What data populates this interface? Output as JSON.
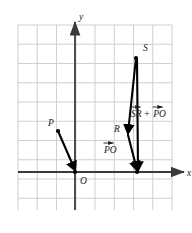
{
  "figure": {
    "type": "vector-diagram",
    "background": "#ffffff",
    "grid": {
      "show": true,
      "color": "#c9c9cf",
      "spacing_px": 19.25,
      "x_start_px": 18,
      "x_end_px": 172,
      "y_start_px": 25,
      "y_end_px": 210,
      "columns": 9,
      "rows": 10
    },
    "axes": {
      "color": "#3a3a3a",
      "x_axis": {
        "label": "x",
        "y_px": 172,
        "x_from_px": 18,
        "x_to_px": 184,
        "arrow": "right"
      },
      "y_axis": {
        "label": "y",
        "x_px": 75,
        "y_from_px": 210,
        "y_to_px": 22,
        "arrow": "up"
      }
    },
    "points": [
      {
        "name": "P",
        "label": "P",
        "x_px": 58,
        "y_px": 131,
        "label_x_px": 48,
        "label_y_px": 126,
        "dot": true
      },
      {
        "name": "O",
        "label": "O",
        "x_px": 75,
        "y_px": 172,
        "label_x_px": 80,
        "label_y_px": 184,
        "dot": true
      },
      {
        "name": "R",
        "label": "R",
        "x_px": 128,
        "y_px": 133,
        "label_x_px": 114,
        "label_y_px": 132,
        "dot": false
      },
      {
        "name": "S",
        "label": "S",
        "x_px": 136,
        "y_px": 58,
        "label_x_px": 143,
        "label_y_px": 51,
        "dot": true
      },
      {
        "name": "T",
        "label": "",
        "x_px": 137,
        "y_px": 172,
        "label_x_px": 0,
        "label_y_px": 0,
        "dot": true
      }
    ],
    "vectors": [
      {
        "name": "PO",
        "from": "P",
        "to": "O",
        "from_x_px": 58,
        "from_y_px": 131,
        "to_x_px": 75,
        "to_y_px": 170,
        "color": "#000000",
        "width": 2.1
      },
      {
        "name": "SR",
        "from": "S",
        "to": "R",
        "from_x_px": 136,
        "from_y_px": 58,
        "to_x_px": 128,
        "to_y_px": 133,
        "color": "#000000",
        "width": 2.1
      },
      {
        "name": "RT",
        "from": "R",
        "to": "T",
        "from_x_px": 128,
        "from_y_px": 135,
        "to_x_px": 137,
        "to_y_px": 170,
        "color": "#000000",
        "width": 2.1
      },
      {
        "name": "sum-ST",
        "from": "S",
        "to": "T",
        "from_x_px": 137,
        "from_y_px": 59,
        "to_x_px": 138,
        "to_y_px": 170,
        "color": "#000000",
        "width": 2.1
      }
    ],
    "annotations": [
      {
        "name": "sum-label",
        "text_a": "SR",
        "operator": "+",
        "text_b": "PO",
        "x_px": 131,
        "y_px": 117,
        "overarrow": true
      },
      {
        "name": "po-label",
        "text_a": "PO",
        "operator": "",
        "text_b": "",
        "x_px": 104,
        "y_px": 153,
        "overarrow": true
      }
    ]
  }
}
